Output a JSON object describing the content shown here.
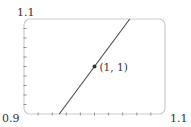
{
  "chart_data": {
    "type": "line",
    "title": "",
    "xlabel": "",
    "ylabel": "",
    "xlim": [
      0.9,
      1.1
    ],
    "ylim": [
      0.9,
      1.1
    ],
    "grid": false,
    "legend": null,
    "corner_labels": {
      "y_max": "1.1",
      "origin": "0.9",
      "x_max": "1.1"
    },
    "x_minor_ticks": [
      0.92,
      0.94,
      0.96,
      0.98,
      1.0,
      1.02,
      1.04,
      1.06,
      1.08
    ],
    "y_minor_ticks": [
      0.92,
      0.94,
      0.96,
      0.98,
      1.0,
      1.02,
      1.04,
      1.06,
      1.08
    ],
    "series": [
      {
        "name": "tangent line",
        "equation": "y = 2x - 1",
        "x": [
          0.95,
          1.05
        ],
        "y": [
          0.9,
          1.1
        ],
        "color": "#555555"
      }
    ],
    "annotations": [
      {
        "x": 1,
        "y": 1,
        "text": "(1, 1)",
        "marker": "dot"
      }
    ]
  },
  "colors": {
    "frame": "#cccccc",
    "line": "#555555",
    "ticks": "#888888",
    "text": "#333333"
  }
}
